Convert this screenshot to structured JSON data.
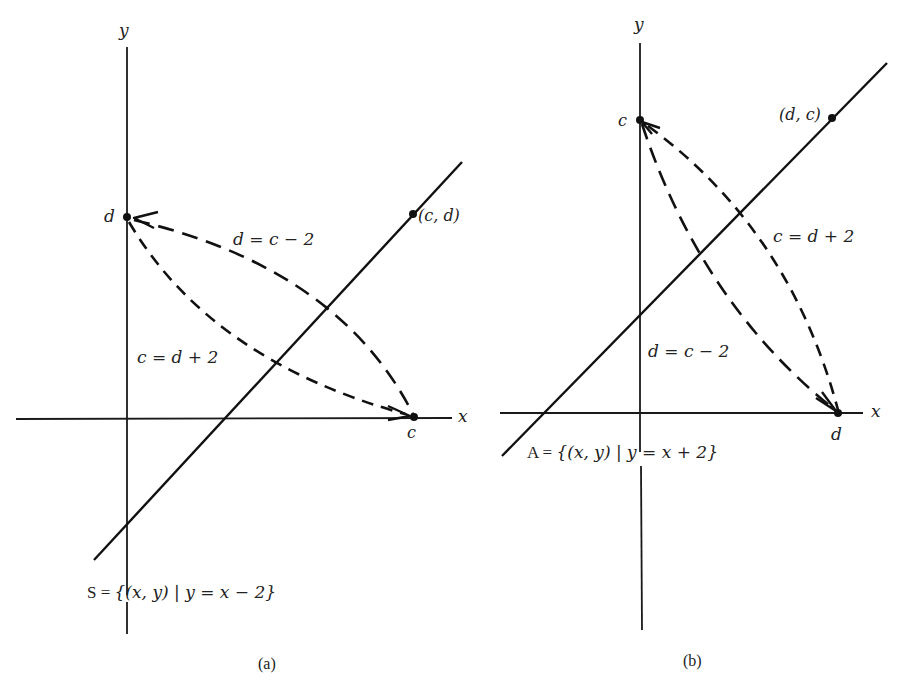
{
  "figure": {
    "panels": [
      {
        "id": "a",
        "caption": "(a)",
        "axis_labels": {
          "x": "x",
          "y": "y"
        },
        "points": {
          "on_y_axis": {
            "label": "d"
          },
          "on_x_axis": {
            "label": "c"
          },
          "on_line": {
            "label": "(c, d)"
          }
        },
        "curves": [
          {
            "label": "d = c − 2",
            "from": "c",
            "to": "d",
            "style": "long-dash"
          },
          {
            "label": "c = d + 2",
            "from": "d",
            "to": "c",
            "style": "short-dash"
          }
        ],
        "set_label": {
          "prefix": "S = ",
          "expr": "{(x, y) | y = x − 2}"
        },
        "line_equation": "y = x - 2"
      },
      {
        "id": "b",
        "caption": "(b)",
        "axis_labels": {
          "x": "x",
          "y": "y"
        },
        "points": {
          "on_y_axis": {
            "label": "c"
          },
          "on_x_axis": {
            "label": "d"
          },
          "on_line": {
            "label": "(d, c)"
          }
        },
        "curves": [
          {
            "label": "c = d + 2",
            "from": "d",
            "to": "c",
            "style": "short-dash"
          },
          {
            "label": "d = c − 2",
            "from": "c",
            "to": "d",
            "style": "long-dash"
          }
        ],
        "set_label": {
          "prefix": "A = ",
          "expr": "{(x, y) | y = x + 2}"
        },
        "line_equation": "y = x + 2"
      }
    ]
  }
}
